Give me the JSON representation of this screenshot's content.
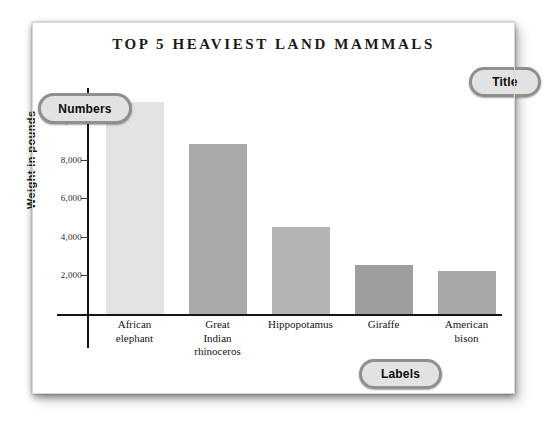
{
  "chart_data": {
    "type": "bar",
    "title": "TOP 5 HEAVIEST LAND MAMMALS",
    "xlabel": "",
    "ylabel": "Weight in pounds",
    "categories": [
      "African elephant",
      "Great Indian rhinoceros",
      "Hippopotamus",
      "Giraffe",
      "American bison"
    ],
    "category_lines": [
      [
        "African",
        "elephant"
      ],
      [
        "Great",
        "Indian",
        "rhinoceros"
      ],
      [
        "Hippopotamus"
      ],
      [
        "Giraffe"
      ],
      [
        "American",
        "bison"
      ]
    ],
    "values": [
      11000,
      8800,
      4500,
      2550,
      2250
    ],
    "bar_colors": [
      "#e3e3e3",
      "#a9a9a9",
      "#b4b4b4",
      "#9e9e9e",
      "#a8a8a8"
    ],
    "ylim": [
      0,
      11500
    ],
    "yticks": [
      2000,
      4000,
      6000,
      8000,
      10000
    ],
    "ytick_labels": [
      "2,000",
      "4,000",
      "6,000",
      "8,000",
      "10,000"
    ],
    "grid": false,
    "legend": null
  },
  "callouts": {
    "title": "Title",
    "numbers": "Numbers",
    "labels": "Labels"
  },
  "colors": {
    "axis": "#151515",
    "page": "#ffffff",
    "callout_fill": "#e2e2e2",
    "callout_border": "#8f8f8f",
    "text": "#141414"
  }
}
